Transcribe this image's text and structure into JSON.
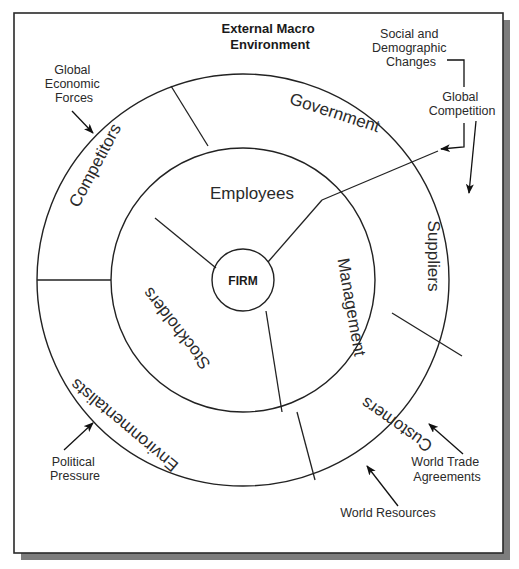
{
  "diagram": {
    "title": [
      "External Macro",
      "Environment"
    ],
    "center": {
      "label": "FIRM"
    },
    "inner_ring": {
      "segments": [
        {
          "label": "Employees"
        },
        {
          "label": "Management"
        },
        {
          "label": "Stockholders"
        }
      ]
    },
    "outer_ring": {
      "segments": [
        {
          "label": "Government"
        },
        {
          "label": "Suppliers"
        },
        {
          "label": "Customers"
        },
        {
          "label": "Environmentalists"
        },
        {
          "label": "Competitors"
        }
      ]
    },
    "external_forces": [
      {
        "label": [
          "Global",
          "Economic",
          "Forces"
        ]
      },
      {
        "label": [
          "Social and",
          "Demographic",
          "Changes"
        ]
      },
      {
        "label": [
          "Global",
          "Competition"
        ]
      },
      {
        "label": [
          "World Trade",
          "Agreements"
        ]
      },
      {
        "label": [
          "World Resources"
        ]
      },
      {
        "label": [
          "Political",
          "Pressure"
        ]
      }
    ],
    "colors": {
      "line": "#222222",
      "frame_shadow": "#7d7d7d",
      "background": "#ffffff"
    }
  }
}
